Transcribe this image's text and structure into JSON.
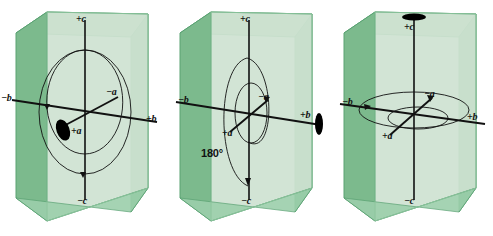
{
  "figure": {
    "type": "crystallographic-axes-diagram",
    "background_color": "#ffffff",
    "panel_count": 3,
    "box": {
      "front_face_color": "#cfe3d2",
      "left_face_color": "#7cba8d",
      "right_face_color": "#6fb585",
      "top_face_color": "#a8d4b2",
      "edge_color": "#5aa273"
    },
    "line_color": "#111111",
    "symbol_color": "#000000"
  },
  "panels": [
    {
      "id": "panel-1",
      "name": "two-fold-axis-along-a",
      "axis_labels": {
        "plus_c": "+c",
        "minus_c": "−c",
        "plus_b": "+b",
        "minus_b": "−b",
        "plus_a": "+a",
        "minus_a": "−a"
      },
      "symbol": "lens-ellipse-two-fold",
      "symbol_position": "plus-a",
      "rotation_arcs": 2,
      "angle_label": ""
    },
    {
      "id": "panel-2",
      "name": "one-hundred-eighty-degree-rotation-about-b",
      "axis_labels": {
        "plus_c": "+c",
        "minus_c": "−c",
        "plus_b": "+b",
        "minus_b": "−b",
        "plus_a": "+a",
        "minus_a": "−a"
      },
      "symbol": "lens-ellipse-two-fold",
      "symbol_position": "plus-b",
      "rotation_arcs": 2,
      "angle_label": "180°"
    },
    {
      "id": "panel-3",
      "name": "rotation-about-c",
      "axis_labels": {
        "plus_c": "+c",
        "minus_c": "−c",
        "plus_b": "+b",
        "minus_b": "−b",
        "plus_a": "+a",
        "minus_a": "−a"
      },
      "symbol": "lens-ellipse-two-fold",
      "symbol_position": "plus-c",
      "rotation_arcs": 2,
      "angle_label": ""
    }
  ]
}
